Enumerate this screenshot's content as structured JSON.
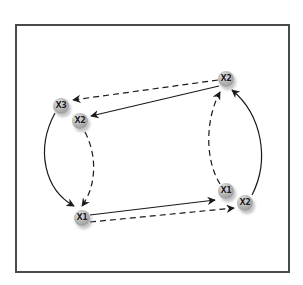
{
  "diagram": {
    "type": "directed-graph",
    "frame": {
      "stroke": "#4a4a4a",
      "background": "#ffffff"
    },
    "style": {
      "node_fill": "#a8a8a8",
      "edge_color": "#1a1a1a"
    },
    "nodes": [
      {
        "id": "n_x3_left",
        "label": "X3",
        "x": 61,
        "y": 106
      },
      {
        "id": "n_x2_left",
        "label": "X2",
        "x": 80,
        "y": 121
      },
      {
        "id": "n_x1_bottom_left",
        "label": "X1",
        "x": 82,
        "y": 218
      },
      {
        "id": "n_x2_top_right",
        "label": "X2",
        "x": 226,
        "y": 79
      },
      {
        "id": "n_x1_right",
        "label": "X1",
        "x": 226,
        "y": 191
      },
      {
        "id": "n_x2_bottom_right",
        "label": "X2",
        "x": 245,
        "y": 203
      }
    ],
    "edges": [
      {
        "from": "n_x2_top_right",
        "to": "n_x3_left",
        "style": "dashed",
        "shape": "straight"
      },
      {
        "from": "n_x2_top_right",
        "to": "n_x2_left",
        "style": "solid",
        "shape": "straight"
      },
      {
        "from": "n_x3_left",
        "to": "n_x1_bottom_left",
        "style": "solid",
        "shape": "curve"
      },
      {
        "from": "n_x2_left",
        "to": "n_x1_bottom_left",
        "style": "dashed",
        "shape": "curve"
      },
      {
        "from": "n_x1_bottom_left",
        "to": "n_x1_right",
        "style": "solid",
        "shape": "straight"
      },
      {
        "from": "n_x1_bottom_left",
        "to": "n_x2_bottom_right",
        "style": "dashed",
        "shape": "straight"
      },
      {
        "from": "n_x1_right",
        "to": "n_x2_top_right",
        "style": "dashed",
        "shape": "curve"
      },
      {
        "from": "n_x2_bottom_right",
        "to": "n_x2_top_right",
        "style": "solid",
        "shape": "curve"
      }
    ]
  }
}
